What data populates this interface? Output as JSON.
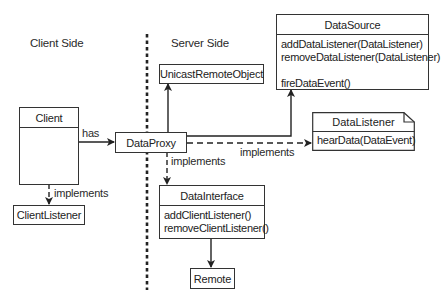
{
  "diagram": {
    "regions": {
      "client_side": "Client Side",
      "server_side": "Server Side"
    },
    "classes": {
      "client": {
        "name": "Client",
        "operations": []
      },
      "client_listener": {
        "name": "ClientListener"
      },
      "data_proxy": {
        "name": "DataProxy"
      },
      "unicast_remote_object": {
        "name": "UnicastRemoteObject"
      },
      "data_source": {
        "name": "DataSource",
        "operations": [
          "addDataListener(DataListener)",
          "removeDataListener(DataListener)",
          "fireDataEvent()"
        ]
      },
      "data_listener": {
        "name": "DataListener",
        "stereotype": "interface-note",
        "operations": [
          "hearData(DataEvent)"
        ]
      },
      "data_interface": {
        "name": "DataInterface",
        "operations": [
          "addClientListener()",
          "removeClientListener()"
        ]
      },
      "remote": {
        "name": "Remote"
      }
    },
    "relations": [
      {
        "from": "Client",
        "to": "DataProxy",
        "type": "association",
        "label": "has"
      },
      {
        "from": "Client",
        "to": "ClientListener",
        "type": "realization",
        "label": "implements"
      },
      {
        "from": "DataProxy",
        "to": "UnicastRemoteObject",
        "type": "inheritance",
        "label": ""
      },
      {
        "from": "DataProxy",
        "to": "DataSource",
        "type": "inheritance",
        "label": ""
      },
      {
        "from": "DataProxy",
        "to": "DataListener",
        "type": "realization",
        "label": "implements"
      },
      {
        "from": "DataProxy",
        "to": "DataInterface",
        "type": "realization",
        "label": "implements"
      },
      {
        "from": "DataInterface",
        "to": "Remote",
        "type": "inheritance",
        "label": ""
      }
    ],
    "labels": {
      "has": "has",
      "implements_client": "implements",
      "implements_listener": "implements",
      "implements_interface": "implements"
    },
    "colors": {
      "line": "#222222",
      "background": "#ffffff",
      "text": "#2a2a2a"
    }
  }
}
